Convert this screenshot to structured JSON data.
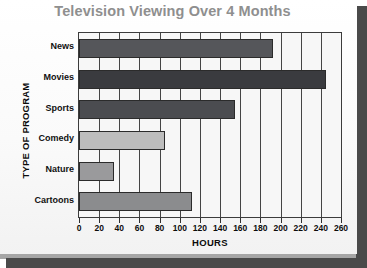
{
  "chart_data": {
    "type": "bar",
    "orientation": "horizontal",
    "title": "Television Viewing Over 4 Months",
    "xlabel": "HOURS",
    "ylabel": "TYPE OF PROGRAM",
    "categories": [
      "News",
      "Movies",
      "Sports",
      "Comedy",
      "Nature",
      "Cartoons"
    ],
    "values": [
      193,
      245,
      155,
      85,
      35,
      112
    ],
    "xlim": [
      0,
      260
    ],
    "xticks": [
      0,
      20,
      40,
      60,
      80,
      100,
      120,
      140,
      160,
      180,
      200,
      220,
      240,
      260
    ],
    "xtick_labels": [
      "0",
      "20",
      "40",
      "60",
      "80",
      "100",
      "120",
      "140",
      "160",
      "180",
      "200",
      "220",
      "240",
      "260"
    ],
    "grid": "vertical",
    "legend": null,
    "bar_colors": [
      "#55565a",
      "#3a3b3f",
      "#4b4c50",
      "#bdbdbd",
      "#9a9a9c",
      "#8b8c8e"
    ],
    "title_color": "#8f8f8f",
    "plot_background": "#f7f7f7",
    "axis_color": "#3c3c3c"
  }
}
